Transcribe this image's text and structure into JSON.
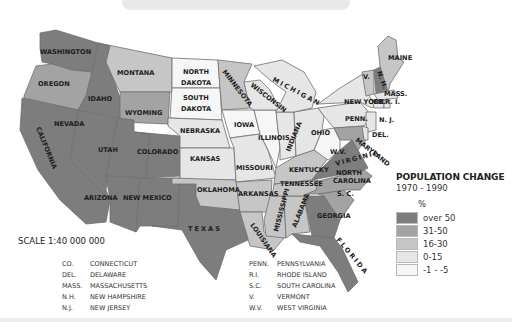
{
  "legend": {
    "title": "POPULATION CHANGE",
    "period": "1970 - 1990",
    "unit": "%",
    "classes": [
      {
        "label": "over 50",
        "color": "#7d7d7d"
      },
      {
        "label": "31-50",
        "color": "#a3a3a3"
      },
      {
        "label": "16-30",
        "color": "#c6c6c6"
      },
      {
        "label": "0-15",
        "color": "#e6e6e6"
      },
      {
        "label": "-1 - -5",
        "color": "#f6f6f6"
      }
    ]
  },
  "scale": "SCALE 1:40 000 000",
  "abbreviations": {
    "left": [
      {
        "abbr": "CO.",
        "name": "CONNECTICUT"
      },
      {
        "abbr": "DEL.",
        "name": "DELAWARE"
      },
      {
        "abbr": "MASS.",
        "name": "MASSACHUSETTS"
      },
      {
        "abbr": "N.H.",
        "name": "NEW HAMPSHIRE"
      },
      {
        "abbr": "N.J.",
        "name": "NEW JERSEY"
      }
    ],
    "right": [
      {
        "abbr": "PENN.",
        "name": "PENNSYLVANIA"
      },
      {
        "abbr": "R.I.",
        "name": "RHODE ISLAND"
      },
      {
        "abbr": "S.C.",
        "name": "SOUTH CAROLINA"
      },
      {
        "abbr": "V.",
        "name": "VERMONT"
      },
      {
        "abbr": "W.V.",
        "name": "WEST VIRGINIA"
      }
    ]
  },
  "state_labels": {
    "washington": "WASHINGTON",
    "oregon": "OREGON",
    "california": "CALIFORNIA",
    "idaho": "IDAHO",
    "nevada": "NEVADA",
    "montana": "MONTANA",
    "wyoming": "WYOMING",
    "utah": "UTAH",
    "colorado": "COLORADO",
    "arizona": "ARIZONA",
    "new_mexico": "NEW MEXICO",
    "north_dakota_1": "NORTH",
    "north_dakota_2": "DAKOTA",
    "south_dakota_1": "SOUTH",
    "south_dakota_2": "DAKOTA",
    "nebraska": "NEBRASKA",
    "kansas": "KANSAS",
    "oklahoma": "OKLAHOMA",
    "texas": "TEXAS",
    "minnesota": "MINNESOTA",
    "iowa": "IOWA",
    "missouri": "MISSOURI",
    "arkansas": "ARKANSAS",
    "louisiana": "LOUISIANA",
    "wisconsin": "WISCONSIN",
    "illinois": "ILLINOIS",
    "michigan": "MICHIGAN",
    "indiana": "INDIANA",
    "ohio": "OHIO",
    "kentucky": "KENTUCKY",
    "tennessee": "TENNESSEE",
    "mississippi": "MISSISSIPPI",
    "alabama": "ALABAMA",
    "georgia": "GEORGIA",
    "florida": "FLORIDA",
    "south_carolina": "S. C.",
    "north_carolina_1": "NORTH",
    "north_carolina_2": "CAROLINA",
    "virginia": "VIRGINIA",
    "west_virginia": "W.V.",
    "maryland": "MARYLAND",
    "delaware": "DEL.",
    "pennsylvania": "PENN.",
    "new_jersey": "N. J.",
    "new_york": "NEW YORK",
    "connecticut": "CO.",
    "rhode_island": "R. I.",
    "massachusetts": "MASS.",
    "vermont": "V.",
    "new_hampshire": "N. H.",
    "maine": "MAINE"
  },
  "state_classes": {
    "over 50": [
      "WASHINGTON",
      "CALIFORNIA",
      "IDAHO",
      "NEVADA",
      "UTAH",
      "COLORADO",
      "ARIZONA",
      "NEW MEXICO",
      "TEXAS",
      "FLORIDA",
      "GEORGIA",
      "VIRGINIA",
      "NEW HAMPSHIRE"
    ],
    "31-50": [
      "OREGON",
      "WYOMING",
      "SOUTH CAROLINA",
      "NORTH CAROLINA",
      "MARYLAND"
    ],
    "16-30": [
      "MONTANA",
      "MINNESOTA",
      "OKLAHOMA",
      "ARKANSAS",
      "LOUISIANA",
      "MISSISSIPPI",
      "ALABAMA",
      "TENNESSEE",
      "KENTUCKY",
      "MAINE",
      "VERMONT"
    ],
    "0-15": [
      "NEBRASKA",
      "KANSAS",
      "MISSOURI",
      "WISCONSIN",
      "MICHIGAN",
      "INDIANA",
      "OHIO",
      "NEW YORK",
      "PENNSYLVANIA",
      "NEW JERSEY",
      "MASSACHUSETTS",
      "CONNECTICUT",
      "RHODE ISLAND",
      "DELAWARE"
    ],
    "-1 - -5": [
      "NORTH DAKOTA",
      "SOUTH DAKOTA",
      "IOWA",
      "ILLINOIS",
      "WEST VIRGINIA"
    ]
  }
}
